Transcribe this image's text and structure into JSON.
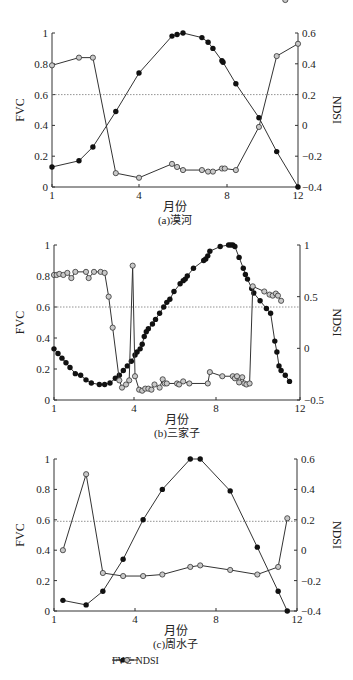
{
  "legend": {
    "fvc": "FVC",
    "ndsi": "NDSI"
  },
  "chart_data": [
    {
      "type": "line",
      "title": "(a)漠河",
      "xlabel": "月份",
      "ylabel": "FVC",
      "ylabel_right": "NDSI",
      "xticks": [
        1,
        4,
        8,
        12
      ],
      "xtick_px": [
        52,
        139,
        227,
        298
      ],
      "ylim": [
        0,
        1
      ],
      "yticks": [
        0,
        0.2,
        0.4,
        0.6,
        0.8,
        1
      ],
      "ytick_labels": [
        "0",
        "0.2",
        "0.4",
        "0.6",
        "0.8",
        "1"
      ],
      "ylim_right": [
        -0.4,
        0.6
      ],
      "yticks_right": [
        -0.4,
        -0.2,
        0,
        0.2,
        0.4,
        0.6
      ],
      "ytick_labels_right": [
        "−0.4",
        "−0.2",
        "0",
        "0.2",
        "0.4",
        "0.6"
      ],
      "threshold_fvc": 0.6,
      "frame": {
        "top": 33,
        "bottom": 187
      },
      "series": [
        {
          "name": "FVC",
          "axis": "left",
          "x": [
            1.0,
            1.93,
            2.41,
            3.2,
            4.0,
            5.5,
            5.73,
            6.0,
            6.86,
            7.14,
            7.36,
            7.77,
            7.82,
            8.5,
            9.8,
            10.8,
            12.0
          ],
          "values": [
            0.13,
            0.17,
            0.26,
            0.49,
            0.74,
            0.98,
            0.99,
            1.0,
            0.97,
            0.94,
            0.9,
            0.82,
            0.81,
            0.67,
            0.45,
            0.23,
            0.0
          ]
        },
        {
          "name": "NDSI",
          "axis": "right",
          "x": [
            1.0,
            1.93,
            2.41,
            3.2,
            4.0,
            5.5,
            5.73,
            6.0,
            6.86,
            7.14,
            7.36,
            7.77,
            7.9,
            8.5,
            9.8,
            10.8,
            12.0
          ],
          "values": [
            0.39,
            0.44,
            0.44,
            -0.31,
            -0.34,
            -0.25,
            -0.27,
            -0.29,
            -0.29,
            -0.3,
            -0.3,
            -0.28,
            -0.28,
            -0.29,
            -0.01,
            0.45,
            0.53
          ]
        }
      ]
    },
    {
      "type": "line",
      "title": "(b)三家子",
      "xlabel": "月份",
      "ylabel": "FVC",
      "ylabel_right": "NDSI",
      "xticks": [
        1,
        4,
        8,
        12
      ],
      "xtick_px": [
        54,
        134,
        216,
        300
      ],
      "ylim": [
        0,
        1
      ],
      "yticks": [
        0,
        0.2,
        0.4,
        0.6,
        0.8,
        1
      ],
      "ytick_labels": [
        "0",
        "0.2",
        "0.4",
        "0.6",
        "0.8",
        "1"
      ],
      "ylim_right": [
        -0.5,
        1
      ],
      "yticks_right": [
        -0.5,
        0,
        0.5,
        1
      ],
      "ytick_labels_right": [
        "−0.5",
        "0",
        "0.5",
        "1"
      ],
      "threshold_fvc": 0.6,
      "frame": {
        "top": 245,
        "bottom": 400
      },
      "series": [
        {
          "name": "FVC",
          "axis": "left",
          "x": [
            1.0,
            1.15,
            1.3,
            1.45,
            1.6,
            1.8,
            2.0,
            2.2,
            2.4,
            2.7,
            2.9,
            3.1,
            3.3,
            3.45,
            3.6,
            3.75,
            3.9,
            4.05,
            4.15,
            4.3,
            4.4,
            4.5,
            4.6,
            4.7,
            4.9,
            5.05,
            5.25,
            5.45,
            5.6,
            5.75,
            5.95,
            6.25,
            6.4,
            6.5,
            6.6,
            6.9,
            7.4,
            7.5,
            7.6,
            7.7,
            8.2,
            8.6,
            8.7,
            8.8,
            8.9,
            9.1,
            9.3,
            9.4,
            9.5,
            9.7,
            9.8,
            10.1,
            10.4,
            10.6,
            10.8,
            10.9,
            11.0,
            11.1,
            11.3,
            11.5
          ],
          "values": [
            0.33,
            0.3,
            0.27,
            0.24,
            0.21,
            0.17,
            0.16,
            0.13,
            0.11,
            0.1,
            0.1,
            0.11,
            0.14,
            0.16,
            0.19,
            0.22,
            0.25,
            0.29,
            0.31,
            0.33,
            0.36,
            0.41,
            0.44,
            0.46,
            0.49,
            0.52,
            0.56,
            0.6,
            0.63,
            0.65,
            0.7,
            0.75,
            0.77,
            0.78,
            0.8,
            0.85,
            0.9,
            0.91,
            0.93,
            0.96,
            0.99,
            1.0,
            1.0,
            1.0,
            0.99,
            0.92,
            0.85,
            0.81,
            0.78,
            0.72,
            0.69,
            0.64,
            0.59,
            0.56,
            0.38,
            0.31,
            0.22,
            0.19,
            0.16,
            0.12,
            0.08,
            0.05,
            0.0
          ]
        },
        {
          "name": "NDSI",
          "axis": "right",
          "x": [
            1.0,
            1.1,
            1.2,
            1.35,
            1.5,
            1.65,
            1.8,
            2.2,
            2.3,
            2.5,
            2.75,
            2.9,
            3.05,
            3.2,
            3.45,
            3.55,
            3.7,
            3.82,
            3.95,
            4.05,
            4.25,
            4.4,
            4.55,
            4.7,
            4.85,
            5.0,
            5.25,
            5.4,
            5.5,
            5.6,
            6.1,
            6.2,
            6.4,
            6.7,
            7.6,
            7.7,
            8.3,
            8.8,
            8.9,
            9.0,
            9.1,
            9.25,
            9.35,
            9.45,
            9.6,
            9.75,
            10.3,
            10.55,
            10.7,
            10.85,
            10.95,
            11.1,
            11.3
          ],
          "values": [
            0.71,
            0.71,
            0.72,
            0.71,
            0.73,
            0.68,
            0.74,
            0.74,
            0.68,
            0.74,
            0.74,
            0.73,
            0.5,
            0.2,
            -0.31,
            -0.38,
            -0.35,
            -0.31,
            0.8,
            -0.27,
            -0.4,
            -0.41,
            -0.39,
            -0.39,
            -0.4,
            -0.35,
            -0.38,
            -0.3,
            -0.34,
            -0.34,
            -0.34,
            -0.35,
            -0.32,
            -0.34,
            -0.34,
            -0.23,
            -0.27,
            -0.27,
            -0.29,
            -0.27,
            -0.33,
            -0.28,
            -0.34,
            -0.35,
            -0.34,
            0.6,
            0.55,
            0.52,
            0.51,
            0.53,
            0.51,
            0.46
          ]
        }
      ]
    },
    {
      "type": "line",
      "title": "(c)周水子",
      "xlabel": "月份",
      "ylabel": "FVC",
      "ylabel_right": "NDSI",
      "xticks": [
        1,
        4,
        8,
        12
      ],
      "xtick_px": [
        54,
        135,
        216,
        297
      ],
      "ylim": [
        0,
        1
      ],
      "yticks": [
        0,
        0.2,
        0.4,
        0.6,
        0.8,
        1
      ],
      "ytick_labels": [
        "0",
        "0.2",
        "0.4",
        "0.6",
        "0.8",
        "1"
      ],
      "ylim_right": [
        -0.4,
        0.6
      ],
      "yticks_right": [
        -0.4,
        -0.2,
        0,
        0.2,
        0.4,
        0.6
      ],
      "ytick_labels_right": [
        "−0.4",
        "−0.2",
        "0",
        "0.2",
        "0.4",
        "0.6"
      ],
      "threshold_fvc": 0.59,
      "frame": {
        "top": 459,
        "bottom": 611
      },
      "series": [
        {
          "name": "FVC",
          "axis": "left",
          "x": [
            1.33,
            2.19,
            2.81,
            3.56,
            4.4,
            5.35,
            6.73,
            7.22,
            8.7,
            10.04,
            11.07,
            11.52
          ],
          "values": [
            0.07,
            0.04,
            0.13,
            0.34,
            0.6,
            0.8,
            1.0,
            1.0,
            0.79,
            0.42,
            0.13,
            0.0
          ]
        },
        {
          "name": "NDSI",
          "axis": "right",
          "x": [
            1.33,
            2.19,
            2.81,
            3.56,
            4.4,
            5.35,
            6.73,
            7.22,
            8.7,
            10.04,
            11.07,
            11.52
          ],
          "values": [
            0.0,
            0.5,
            -0.15,
            -0.17,
            -0.17,
            -0.16,
            -0.11,
            -0.1,
            -0.13,
            -0.16,
            -0.11,
            0.21
          ]
        }
      ]
    }
  ]
}
